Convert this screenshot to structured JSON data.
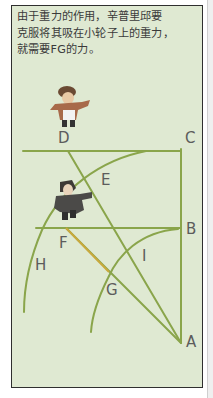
{
  "caption": {
    "lines": [
      "由于重力的作用，辛普里邱要",
      "克服将其吸在小轮子上的重力，",
      "就需要FG的力。"
    ]
  },
  "diagram": {
    "labels": {
      "A": "A",
      "B": "B",
      "C": "C",
      "D": "D",
      "E": "E",
      "F": "F",
      "G": "G",
      "H": "H",
      "I": "I"
    },
    "colors": {
      "background": "#dfe9d2",
      "line": "#8aa54b",
      "force_line": "#c9a93c",
      "label_text": "#5c5c5c",
      "border": "#2f2f2f"
    },
    "characters": [
      {
        "name": "figure-top",
        "description": "cartoon man pointing right, brown coat"
      },
      {
        "name": "figure-middle",
        "description": "cartoon man pointing right, dark coat"
      }
    ]
  }
}
